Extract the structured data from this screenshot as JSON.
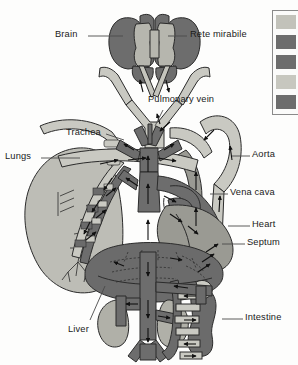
{
  "figure": {
    "background": "#fdfdfc"
  },
  "palette": {
    "oxygenated_light": "#c9c9c2",
    "deoxygenated_dark": "#6d6d6d",
    "mixed_mid": "#9a9a93",
    "organ_light": "#bdbdb6",
    "organ_dark": "#6b6b6b",
    "outline": "#2b2b2b",
    "label_text": "#1a1a1a",
    "leader_line": "#4a4a4a"
  },
  "labels": [
    {
      "id": "brain",
      "text": "Brain",
      "x": 55,
      "y": 30,
      "anchor": "left",
      "leader": {
        "x1": 88,
        "y1": 36,
        "x2": 123,
        "y2": 36
      }
    },
    {
      "id": "rete-mirabile",
      "text": "Rete mirabile",
      "x": 190,
      "y": 30,
      "anchor": "left",
      "leader": {
        "x1": 168,
        "y1": 36,
        "x2": 187,
        "y2": 36
      }
    },
    {
      "id": "pulmonary-vein",
      "text": "Pulmonary vein",
      "x": 148,
      "y": 95,
      "anchor": "left",
      "leader": {
        "x1": 163,
        "y1": 110,
        "x2": 155,
        "y2": 126
      }
    },
    {
      "id": "trachea",
      "text": "Trachea",
      "x": 66,
      "y": 128,
      "anchor": "left",
      "leader": {
        "x1": 106,
        "y1": 134,
        "x2": 124,
        "y2": 140
      }
    },
    {
      "id": "lungs",
      "text": "Lungs",
      "x": 5,
      "y": 152,
      "anchor": "left",
      "leader": {
        "x1": 41,
        "y1": 158,
        "x2": 80,
        "y2": 158
      }
    },
    {
      "id": "aorta",
      "text": "Aorta",
      "x": 252,
      "y": 150,
      "anchor": "left",
      "leader": {
        "x1": 232,
        "y1": 156,
        "x2": 250,
        "y2": 156
      }
    },
    {
      "id": "vena-cava",
      "text": "Vena cava",
      "x": 230,
      "y": 188,
      "anchor": "left",
      "leader": {
        "x1": 210,
        "y1": 194,
        "x2": 228,
        "y2": 194
      }
    },
    {
      "id": "heart",
      "text": "Heart",
      "x": 252,
      "y": 220,
      "anchor": "left",
      "leader": {
        "x1": 228,
        "y1": 226,
        "x2": 250,
        "y2": 226
      }
    },
    {
      "id": "septum",
      "text": "Septum",
      "x": 247,
      "y": 238,
      "anchor": "left",
      "leader": {
        "x1": 222,
        "y1": 244,
        "x2": 245,
        "y2": 244
      }
    },
    {
      "id": "intestine",
      "text": "Intestine",
      "x": 245,
      "y": 313,
      "anchor": "left",
      "leader": {
        "x1": 222,
        "y1": 319,
        "x2": 243,
        "y2": 319
      }
    },
    {
      "id": "liver",
      "text": "Liver",
      "x": 68,
      "y": 325,
      "anchor": "left",
      "leader": {
        "x1": 90,
        "y1": 324,
        "x2": 105,
        "y2": 286
      }
    }
  ],
  "legend": {
    "box": {
      "x": 272,
      "y": 10,
      "width": 26,
      "height": 103
    },
    "swatches": [
      {
        "index": 0,
        "color": "#c2c2ba",
        "y": 4
      },
      {
        "index": 1,
        "color": "#6d6d6d",
        "y": 24
      },
      {
        "index": 2,
        "color": "#6d6d6d",
        "y": 44
      },
      {
        "index": 3,
        "color": "#c7c7bf",
        "y": 64
      },
      {
        "index": 4,
        "color": "#6d6d6d",
        "y": 84
      }
    ]
  },
  "organs": [
    {
      "id": "brain-lobes",
      "name": "Brain",
      "fill": "#6d6d6d"
    },
    {
      "id": "rete",
      "name": "Rete mirabile",
      "fill": "#b6b6ae"
    },
    {
      "id": "lung",
      "name": "Lung",
      "fill": "#bdbdb6"
    },
    {
      "id": "liver",
      "name": "Liver",
      "fill": "#6b6b6b"
    },
    {
      "id": "kidney-left",
      "name": "Kidney",
      "fill": "#b0b0a8"
    },
    {
      "id": "kidney-right",
      "name": "Kidney",
      "fill": "#b0b0a8"
    },
    {
      "id": "intestine",
      "name": "Intestine",
      "fill": "#6b6b6b"
    },
    {
      "id": "heart",
      "name": "Heart",
      "fill": "#9a9a93"
    }
  ],
  "flow_arrows": {
    "count": 34,
    "description": "directional blood flow indicators"
  }
}
